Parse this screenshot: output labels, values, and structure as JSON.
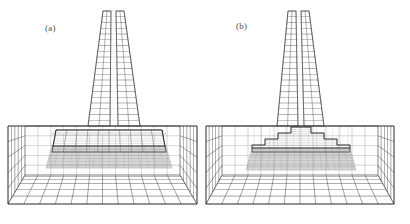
{
  "figure": {
    "kind": "finite-element-mesh-figure",
    "background_color": "#ffffff",
    "line_color": "#2b2b2b",
    "faint_line_color": "#8d8d8d",
    "shade_color": "#9a9a9a",
    "panels": [
      {
        "id": "a",
        "label": "(a)",
        "label_color": "#4a4a4a",
        "description_parts": {
          "tower": "tapered-pylon-mesh",
          "footing": "flat-block-footing",
          "soil": "soil-box-mesh"
        },
        "geometry": {
          "origin_x": 0,
          "soil_box": {
            "back_top_left": [
              25,
              126
            ],
            "back_top_right": [
              180,
              126
            ],
            "back_bottom_left": [
              25,
              175
            ],
            "back_bottom_right": [
              180,
              175
            ],
            "front_bottom_left": [
              8,
              204
            ],
            "front_bottom_right": [
              197,
              204
            ],
            "back_cols": 12,
            "back_rows": 5,
            "floor_rows": 6
          },
          "tower": {
            "top_left": [
              103,
              11
            ],
            "top_right": [
              124,
              11
            ],
            "bottom_left": [
              88,
              126
            ],
            "bottom_right": [
              140,
              126
            ],
            "mid_left": [
              111,
              11
            ],
            "mid_right": [
              116,
              11
            ],
            "mid_bottom_left": [
              110,
              126
            ],
            "mid_bottom_right": [
              118,
              126
            ],
            "rows": 20
          },
          "footing": {
            "type": "flat",
            "top_y": 130,
            "base_y": 152,
            "shade_top_y": 146,
            "shade_bottom_y": 168,
            "left_x": 56,
            "right_x": 162,
            "front_left_x": 52,
            "front_right_x": 166,
            "steps": 1,
            "layer_rows": 8
          }
        }
      },
      {
        "id": "b",
        "label": "(b)",
        "label_color": "#4a4a4a",
        "description_parts": {
          "tower": "tapered-pylon-mesh",
          "footing": "stepped-pyramid-footing",
          "soil": "soil-box-mesh"
        },
        "geometry": {
          "origin_x": 205,
          "soil_box": {
            "back_top_left": [
              222,
              126
            ],
            "back_top_right": [
              378,
              126
            ],
            "back_bottom_left": [
              222,
              175
            ],
            "back_bottom_right": [
              378,
              175
            ],
            "front_bottom_left": [
              206,
              204
            ],
            "front_bottom_right": [
              394,
              204
            ],
            "back_cols": 12,
            "back_rows": 5,
            "floor_rows": 6
          },
          "tower": {
            "top_left": [
              288,
              11
            ],
            "top_right": [
              309,
              11
            ],
            "bottom_left": [
              277,
              126
            ],
            "bottom_right": [
              324,
              126
            ],
            "mid_left": [
              296,
              11
            ],
            "mid_right": [
              301,
              11
            ],
            "mid_bottom_left": [
              298,
              126
            ],
            "mid_bottom_right": [
              304,
              126
            ],
            "rows": 20
          },
          "footing": {
            "type": "stepped",
            "top_y": 127,
            "base_y": 152,
            "shade_top_y": 148,
            "shade_bottom_y": 170,
            "left_x": 252,
            "right_x": 350,
            "steps": 4,
            "step_inset": 13,
            "step_height": 6,
            "layer_rows": 8
          }
        }
      }
    ]
  }
}
